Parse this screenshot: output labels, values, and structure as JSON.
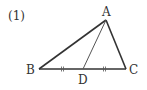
{
  "problem_number": "(1)",
  "colors": {
    "stroke": "#333333",
    "median": "#555555",
    "background": "#ffffff"
  },
  "diagram": {
    "type": "triangle",
    "vertices": {
      "A": {
        "label": "A",
        "x": 106,
        "y": 20
      },
      "B": {
        "label": "B",
        "x": 39,
        "y": 69
      },
      "C": {
        "label": "C",
        "x": 126,
        "y": 69
      }
    },
    "points": {
      "D": {
        "label": "D",
        "x": 83,
        "y": 69,
        "on": "BC",
        "note": "midpoint, BD = DC"
      }
    },
    "segments": [
      "AB",
      "AC",
      "BC",
      "AD"
    ],
    "equal_marks": [
      {
        "segment": "BD",
        "mark": "double-tick"
      },
      {
        "segment": "DC",
        "mark": "double-tick"
      }
    ]
  }
}
